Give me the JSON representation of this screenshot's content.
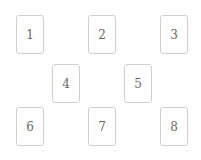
{
  "board": {
    "cards": [
      {
        "label": "1"
      },
      {
        "label": "2"
      },
      {
        "label": "3"
      },
      {
        "label": "4"
      },
      {
        "label": "5"
      },
      {
        "label": "6"
      },
      {
        "label": "7"
      },
      {
        "label": "8"
      }
    ]
  },
  "colors": {
    "background": "#ffffff",
    "card_border": "#cfcfcf",
    "card_text": "#666666"
  }
}
